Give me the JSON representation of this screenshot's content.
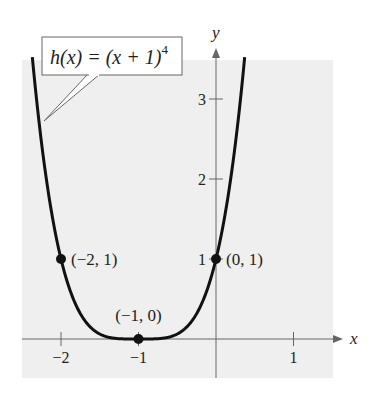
{
  "chart_data": {
    "type": "line",
    "title": "",
    "function_label": "h(x) = (x + 1)",
    "function_exponent": "4",
    "xlabel": "x",
    "ylabel": "y",
    "xlim": [
      -2.5,
      1.5
    ],
    "ylim": [
      -0.4,
      3.9
    ],
    "x_ticks": [
      -2,
      -1,
      1
    ],
    "x_tick_labels": [
      "−2",
      "−1",
      "1"
    ],
    "y_ticks": [
      1,
      2,
      3
    ],
    "y_tick_labels": [
      "1",
      "2",
      "3"
    ],
    "grid": false,
    "series": [
      {
        "name": "h(x) = (x + 1)^4",
        "x": [
          -2.37,
          -2.25,
          -2.0,
          -1.75,
          -1.5,
          -1.25,
          -1.0,
          -0.75,
          -0.5,
          -0.25,
          0.0,
          0.25,
          0.37
        ],
        "values": [
          3.52,
          2.44,
          1.0,
          0.32,
          0.06,
          0.004,
          0.0,
          0.004,
          0.06,
          0.32,
          1.0,
          2.44,
          3.52
        ]
      }
    ],
    "points": [
      {
        "x": -2,
        "y": 1,
        "label": "(−2, 1)"
      },
      {
        "x": -1,
        "y": 0,
        "label": "(−1, 0)"
      },
      {
        "x": 0,
        "y": 1,
        "label": "(0, 1)"
      }
    ],
    "colors": {
      "background": "#f0f0f0",
      "curve": "#111111",
      "axis": "#555555"
    }
  }
}
